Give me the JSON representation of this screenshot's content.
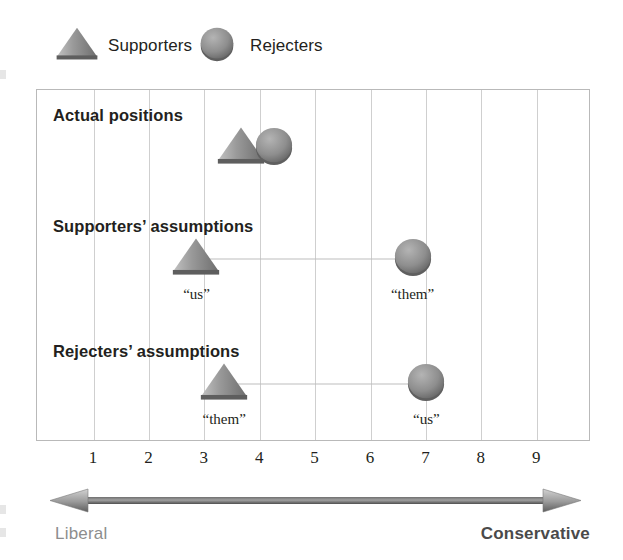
{
  "legend": {
    "items": [
      {
        "icon": "triangle-icon",
        "label": "Supporters",
        "shape": "triangle",
        "x": 55
      },
      {
        "icon": "circle-icon",
        "label": "Rejecters",
        "shape": "circle",
        "x": 198
      }
    ]
  },
  "axis": {
    "ticks": [
      1,
      2,
      3,
      4,
      5,
      6,
      7,
      8,
      9
    ],
    "left_label": "Liberal",
    "right_label": "Conservative",
    "arrow": "double-headed-arrow"
  },
  "rows": [
    {
      "label": "Actual positions",
      "points": [
        {
          "shape": "triangle",
          "series": "Supporters",
          "value": 3.65,
          "label": ""
        },
        {
          "shape": "circle",
          "series": "Rejecters",
          "value": 4.25,
          "label": ""
        }
      ],
      "connector": false
    },
    {
      "label": "Supporters’ assumptions",
      "points": [
        {
          "shape": "triangle",
          "series": "Supporters",
          "value": 2.85,
          "label": "“us”"
        },
        {
          "shape": "circle",
          "series": "Rejecters",
          "value": 6.75,
          "label": "“them”"
        }
      ],
      "connector": true
    },
    {
      "label": "Rejecters’ assumptions",
      "points": [
        {
          "shape": "triangle",
          "series": "Supporters",
          "value": 3.35,
          "label": "“them”"
        },
        {
          "shape": "circle",
          "series": "Rejecters",
          "value": 7.0,
          "label": "“us”"
        }
      ],
      "connector": true
    }
  ],
  "colors": {
    "triangle": "#8a8a8a",
    "circle": "#8e8e8e",
    "grid": "#cfcfcf",
    "border": "#b9b9b9",
    "text": "#231f20",
    "liberal": "#8d8d8d",
    "conservative": "#4a4a4a"
  },
  "chart_data": {
    "type": "scatter",
    "title": "",
    "xlabel": "Liberal – Conservative",
    "ylabel": "",
    "xlim": [
      0.33,
      9.67
    ],
    "ylim": [
      0,
      3
    ],
    "grid": true,
    "legend_position": "top-left",
    "x_ticks": [
      1,
      2,
      3,
      4,
      5,
      6,
      7,
      8,
      9
    ],
    "x_endpoint_labels": [
      "Liberal",
      "Conservative"
    ],
    "categories": [
      "Actual positions",
      "Supporters’ assumptions",
      "Rejecters’ assumptions"
    ],
    "series": [
      {
        "name": "Supporters",
        "marker": "triangle",
        "values": [
          3.65,
          2.85,
          3.35
        ]
      },
      {
        "name": "Rejecters",
        "marker": "circle",
        "values": [
          4.25,
          6.75,
          7.0
        ]
      }
    ],
    "annotations": [
      {
        "row": "Supporters’ assumptions",
        "series": "Supporters",
        "text": "“us”",
        "x": 2.85
      },
      {
        "row": "Supporters’ assumptions",
        "series": "Rejecters",
        "text": "“them”",
        "x": 6.75
      },
      {
        "row": "Rejecters’ assumptions",
        "series": "Supporters",
        "text": "“them”",
        "x": 3.35
      },
      {
        "row": "Rejecters’ assumptions",
        "series": "Rejecters",
        "text": "“us”",
        "x": 7.0
      }
    ]
  }
}
